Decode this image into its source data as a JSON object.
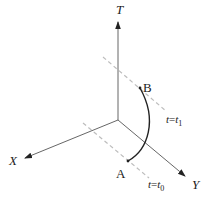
{
  "diagram": {
    "type": "spacetime-axes",
    "axes": {
      "t": {
        "label": "T"
      },
      "x": {
        "label": "X"
      },
      "y": {
        "label": "Y"
      }
    },
    "points": {
      "a": {
        "label": "A"
      },
      "b": {
        "label": "B"
      }
    },
    "time_slices": {
      "upper": {
        "var": "t",
        "eq": "=",
        "rhs": "t",
        "sub": "1"
      },
      "lower": {
        "var": "t",
        "eq": "=",
        "rhs": "t",
        "sub": "0"
      }
    },
    "colors": {
      "axis": "#555555",
      "dashed": "#bdbdbd",
      "curve": "#222222",
      "text": "#222222"
    }
  }
}
